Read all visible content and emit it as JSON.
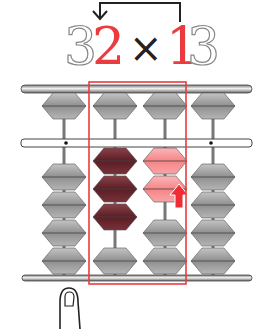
{
  "problem": {
    "digits": [
      {
        "char": "3",
        "style": "outline"
      },
      {
        "char": "2",
        "style": "highlight"
      },
      {
        "char": "×",
        "style": "operator"
      },
      {
        "char": "1",
        "style": "highlight"
      },
      {
        "char": "3",
        "style": "outline"
      }
    ],
    "arrow": "from 1 to 2"
  },
  "abacus": {
    "rods": 4,
    "highlight_box_rods": [
      2,
      3
    ],
    "rod_states": [
      {
        "rod": 1,
        "heaven_up": true,
        "earth_beads_up": 0,
        "color": "gray"
      },
      {
        "rod": 2,
        "heaven_up": true,
        "earth_beads_up": 3,
        "color": "dark-red",
        "value": 3
      },
      {
        "rod": 3,
        "heaven_up": true,
        "earth_beads_up": 2,
        "color": "light-red",
        "value": 2,
        "action": "push-up-arrow"
      },
      {
        "rod": 4,
        "heaven_up": true,
        "earth_beads_up": 0,
        "color": "gray"
      }
    ]
  },
  "colors": {
    "highlight": "#ea3b3f",
    "dark_bead": "#6b2a30",
    "light_bead": "#f59a9c",
    "gray_bead": "#9a9a9a"
  }
}
